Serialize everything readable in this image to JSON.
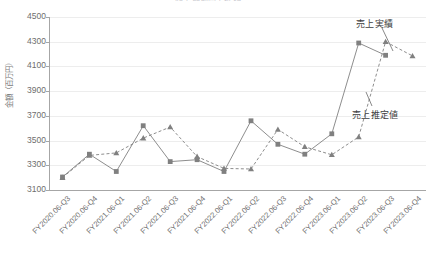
{
  "chart": {
    "title": "四半期別売上推移",
    "y_axis_title": "金額（百万円）",
    "annotations": {
      "actual": "売上実績",
      "estimate": "売上推定値"
    }
  },
  "chart_data": {
    "type": "line",
    "title": "四半期別売上推移",
    "xlabel": "",
    "ylabel": "金額（百万円）",
    "ylim": [
      3100,
      4500
    ],
    "ytick_step": 200,
    "yticks": [
      3100,
      3300,
      3500,
      3700,
      3900,
      4100,
      4300,
      4500
    ],
    "grid": true,
    "legend_position": "annotation-callouts-right",
    "categories": [
      "FY2020.06-Q3",
      "FY2020.06-Q4",
      "FY2021.06-Q1",
      "FY2021.06-Q2",
      "FY2021.06-Q3",
      "FY2021.06-Q4",
      "FY2022.06-Q1",
      "FY2022.06-Q2",
      "FY2022.06-Q3",
      "FY2022.06-Q4",
      "FY2023.06-Q1",
      "FY2023.06-Q2",
      "FY2023.06-Q3",
      "FY2023.06-Q4"
    ],
    "series": [
      {
        "name": "売上実績",
        "style": "solid",
        "marker": "square",
        "color": "#808080",
        "values": [
          3205,
          3390,
          3250,
          3620,
          3330,
          3345,
          3250,
          3660,
          3470,
          3390,
          3555,
          4290,
          4190,
          null
        ]
      },
      {
        "name": "売上推定値",
        "style": "dashed",
        "marker": "triangle",
        "color": "#808080",
        "values": [
          3200,
          3380,
          3400,
          3520,
          3610,
          3370,
          3275,
          3270,
          3590,
          3450,
          3385,
          3530,
          4300,
          4185
        ]
      }
    ]
  },
  "colors": {
    "series": "#808080",
    "gridline": "#ededed",
    "axis": "#a6a6a6",
    "tick_text": "#6e6e6e",
    "annotation_text": "#404040"
  }
}
